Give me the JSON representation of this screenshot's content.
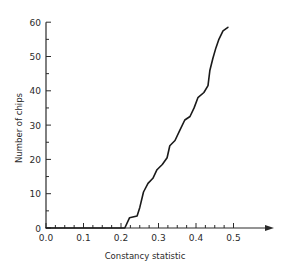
{
  "chart_data": {
    "type": "line",
    "title": "",
    "xlabel": "Constancy statistic",
    "ylabel": "Number of chips",
    "xlim": [
      0.0,
      0.6
    ],
    "ylim": [
      0,
      60
    ],
    "grid": false,
    "legend": null,
    "x_ticks": [
      0.0,
      0.1,
      0.2,
      0.3,
      0.4,
      0.5
    ],
    "x_tick_labels": [
      "0.0",
      "0.1",
      "0.2",
      "0.3",
      "0.4",
      "0.5"
    ],
    "x_minor_step": 0.025,
    "y_ticks": [
      0,
      10,
      20,
      30,
      40,
      50,
      60
    ],
    "y_tick_labels": [
      "0",
      "10",
      "20",
      "30",
      "40",
      "50",
      "60"
    ],
    "y_minor_step": 5,
    "x_axis_arrow": true,
    "series": [
      {
        "name": "cumulative chips",
        "color": "#1a1a1a",
        "x": [
          0.0,
          0.21,
          0.223,
          0.243,
          0.25,
          0.26,
          0.272,
          0.285,
          0.296,
          0.31,
          0.323,
          0.33,
          0.344,
          0.357,
          0.37,
          0.384,
          0.395,
          0.405,
          0.421,
          0.432,
          0.437,
          0.445,
          0.453,
          0.461,
          0.472,
          0.485
        ],
        "y": [
          0,
          0,
          3,
          3.5,
          6,
          10.5,
          13,
          14.5,
          17,
          18.5,
          20.5,
          24,
          25.5,
          28.5,
          31.5,
          32.5,
          35,
          38,
          39.5,
          41.5,
          46,
          49.5,
          52.5,
          55,
          57.5,
          58.5
        ]
      }
    ]
  }
}
